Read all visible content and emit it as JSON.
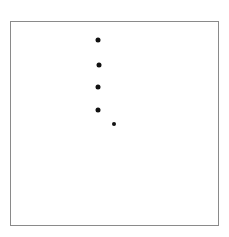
{
  "chart_data": {
    "type": "scatter",
    "title": "",
    "xlabel": "",
    "ylabel": "",
    "grid": false,
    "legend": null,
    "frame": {
      "left": 10,
      "top": 21,
      "right": 219,
      "bottom": 226,
      "color": "#8a8a8a"
    },
    "points": [
      {
        "x": 98,
        "y": 40,
        "size": 5
      },
      {
        "x": 99,
        "y": 65,
        "size": 5
      },
      {
        "x": 98,
        "y": 87,
        "size": 5
      },
      {
        "x": 98,
        "y": 110,
        "size": 5
      },
      {
        "x": 114,
        "y": 124,
        "size": 4
      }
    ],
    "point_color": "#111111"
  }
}
